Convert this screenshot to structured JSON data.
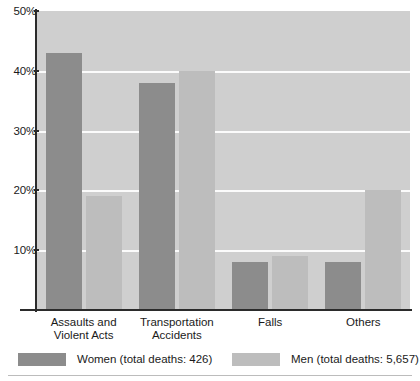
{
  "chart_data": {
    "type": "bar",
    "title": "",
    "xlabel": "",
    "ylabel": "",
    "ylim": [
      0,
      50
    ],
    "grid": true,
    "legend_position": "bottom",
    "categories": [
      "Assaults and Violent Acts",
      "Transportation Accidents",
      "Falls",
      "Others"
    ],
    "category_lines": [
      [
        "Assaults and",
        "Violent Acts"
      ],
      [
        "Transportation",
        "Accidents"
      ],
      [
        "Falls"
      ],
      [
        "Others"
      ]
    ],
    "ytick_labels": [
      "50%",
      "40%",
      "30%",
      "20%",
      "10%"
    ],
    "ytick_values": [
      50,
      40,
      30,
      20,
      10
    ],
    "series": [
      {
        "name": "Women (total deaths: 426)",
        "short_name": "Women",
        "color": "#8c8c8c",
        "values": [
          43,
          38,
          8,
          8
        ]
      },
      {
        "name": "Men (total deaths: 5,657)",
        "short_name": "Men",
        "color": "#bdbdbd",
        "values": [
          19,
          40,
          9,
          20
        ]
      }
    ]
  },
  "legend": {
    "items": [
      {
        "label": "Women (total deaths: 426)",
        "color": "#8c8c8c"
      },
      {
        "label": "Men (total deaths: 5,657)",
        "color": "#bdbdbd"
      }
    ]
  },
  "colors": {
    "women": "#8c8c8c",
    "men": "#bdbdbd",
    "plot_background": "#cfcfcf",
    "gridline": "#fbfbfb",
    "axis": "#2b2b2b"
  }
}
